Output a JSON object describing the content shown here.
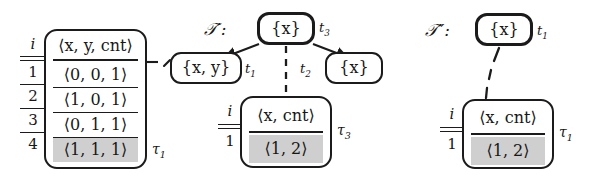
{
  "figure": {
    "kind": "tree-and-relation-diagram",
    "ink_color": "#1b1b1b",
    "highlight_color": "#cfcfcf",
    "background": "#ffffff"
  },
  "left_relation": {
    "name": "tau-1",
    "label": "τ",
    "label_sub": "1",
    "index_header": "i",
    "header": "⟨x, y, cnt⟩",
    "index_values": [
      "1",
      "2",
      "3",
      "4"
    ],
    "rows": [
      {
        "value": "⟨0, 0, 1⟩",
        "highlighted": false
      },
      {
        "value": "⟨1, 0, 1⟩",
        "highlighted": false
      },
      {
        "value": "⟨0, 1, 1⟩",
        "highlighted": false
      },
      {
        "value": "⟨1, 1, 1⟩",
        "highlighted": true
      }
    ]
  },
  "tree_prime": {
    "name": "T-prime",
    "label": "𝒯′:",
    "root": {
      "label": "{x}",
      "tag": "t",
      "tag_sub": "3",
      "bold": true
    },
    "children": [
      {
        "label": "{x, y}",
        "tag": "t",
        "tag_sub": "1",
        "bold": false
      },
      {
        "label": "{x}",
        "tag": "t",
        "tag_sub": "2",
        "bold": false
      }
    ],
    "relation": {
      "name": "tau-3",
      "label": "τ",
      "label_sub": "3",
      "index_header": "i",
      "header": "⟨x, cnt⟩",
      "index_values": [
        "1"
      ],
      "rows": [
        {
          "value": "⟨1, 2⟩",
          "highlighted": true
        }
      ]
    }
  },
  "tree_double_prime": {
    "name": "T-double-prime",
    "label": "𝒯″:",
    "root": {
      "label": "{x}",
      "tag": "t",
      "tag_sub": "1",
      "bold": true
    },
    "relation": {
      "name": "tau-1-right",
      "label": "τ",
      "label_sub": "1",
      "index_header": "i",
      "header": "⟨x, cnt⟩",
      "index_values": [
        "1"
      ],
      "rows": [
        {
          "value": "⟨1, 2⟩",
          "highlighted": true
        }
      ]
    }
  }
}
